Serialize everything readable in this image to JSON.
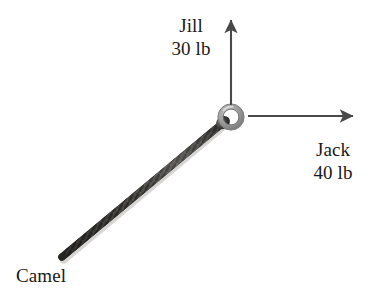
{
  "diagram": {
    "background_color": "#ffffff",
    "ink_color": "#3a3a3a",
    "text_color": "#1a1a1a",
    "ring": {
      "name": "ring",
      "center_x": 231,
      "center_y": 117,
      "outer_radius": 13,
      "inner_radius": 8,
      "color": "#8a8a8a"
    },
    "forces": [
      {
        "id": "jill",
        "agent": "Jill",
        "magnitude": "30 lb",
        "magnitude_value": 30,
        "unit": "lb",
        "direction": "up",
        "angle_deg": 90,
        "style": "arrow",
        "arrow": {
          "x1": 231,
          "y1": 105,
          "x2": 231,
          "y2": 18
        },
        "label_x": 191,
        "label_y": 14
      },
      {
        "id": "jack",
        "agent": "Jack",
        "magnitude": "40 lb",
        "magnitude_value": 40,
        "unit": "lb",
        "direction": "right",
        "angle_deg": 0,
        "style": "arrow",
        "arrow": {
          "x1": 248,
          "y1": 116,
          "x2": 355,
          "y2": 116
        },
        "label_x": 333,
        "label_y": 138
      },
      {
        "id": "camel",
        "agent": "Camel",
        "magnitude": "",
        "magnitude_value": null,
        "unit": "",
        "direction": "down-left",
        "angle_deg": 221,
        "style": "rope",
        "rope": {
          "x1": 224,
          "y1": 122,
          "x2": 62,
          "y2": 257,
          "width": 7
        },
        "label_x": 16,
        "label_y": 264
      }
    ]
  },
  "labels": {
    "jill": {
      "name": "Jill",
      "force": "30 lb"
    },
    "jack": {
      "name": "Jack",
      "force": "40 lb"
    },
    "camel": {
      "name": "Camel",
      "force": ""
    }
  }
}
